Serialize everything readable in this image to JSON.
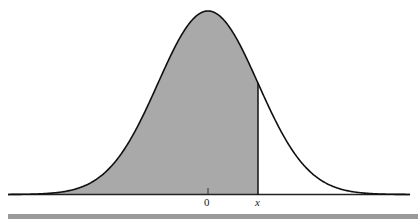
{
  "diagram": {
    "type": "standard-normal-density",
    "shaded_region": "area under curve from -infinity to x",
    "labels": {
      "zero": "0",
      "x": "x"
    },
    "colors": {
      "shade": "#a9a9a9",
      "curve": "#111111",
      "baseline": "#222222",
      "bottom_bar": "#9a9a9a"
    }
  },
  "chart_data": {
    "type": "area",
    "title": "",
    "xlabel": "",
    "ylabel": "",
    "curve": "normal pdf, mean 0",
    "tick_labels": [
      "0",
      "x"
    ],
    "shaded_from": "-inf",
    "shaded_to": "x",
    "x_marker_sd": 1.0
  }
}
